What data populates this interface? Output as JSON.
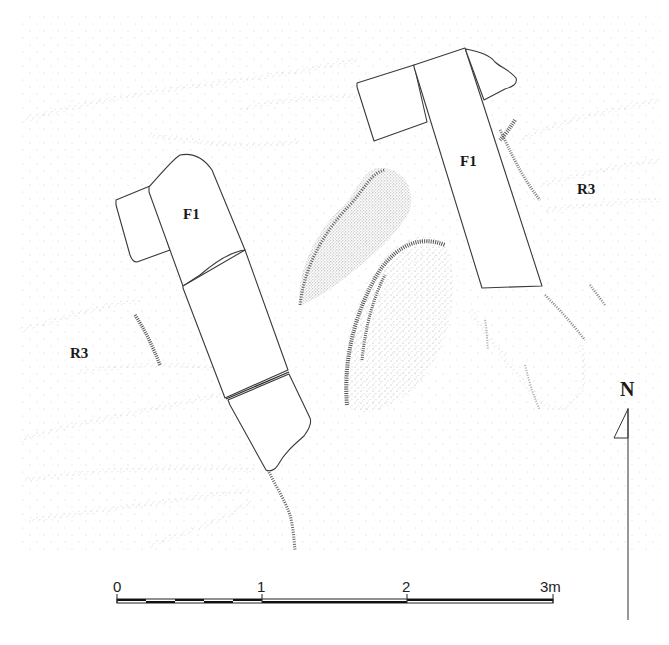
{
  "figure": {
    "type": "archaeological plan",
    "background_color": "#ffffff",
    "line_color": "#3a3a3a",
    "stipple_color": "#1e1e1e"
  },
  "labels": {
    "feature_left": "F1",
    "feature_right": "F1",
    "layer_left": "R3",
    "layer_right": "R3"
  },
  "north_arrow": {
    "label": "N"
  },
  "scale_bar": {
    "ticks": [
      "0",
      "1",
      "2",
      "3m"
    ],
    "unit": "m",
    "length_m": 3
  }
}
